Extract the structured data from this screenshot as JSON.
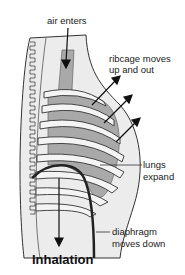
{
  "diagram": {
    "title": "Inhalation",
    "labels": {
      "air_enters": "air enters",
      "ribcage_line1": "ribcage moves",
      "ribcage_line2": "up and out",
      "lungs_line1": "lungs",
      "lungs_line2": "expand",
      "diaphragm_line1": "diaphragm",
      "diaphragm_line2": "moves down"
    },
    "colors": {
      "body_fill": "#ececec",
      "lung_fill": "#a9a9a9",
      "outline": "#333333",
      "arrow": "#111111",
      "background": "#ffffff"
    }
  }
}
